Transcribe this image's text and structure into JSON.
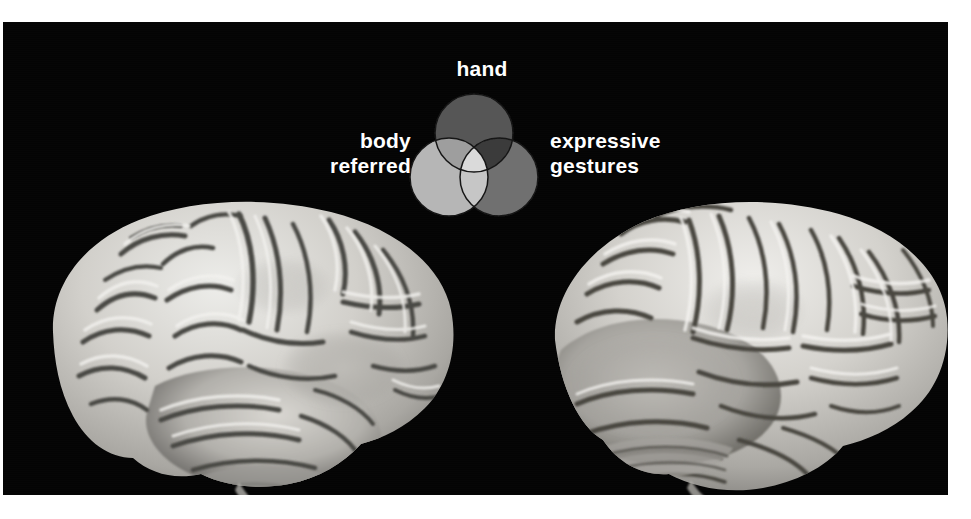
{
  "figure": {
    "panel_background": "#040404",
    "page_background": "#ffffff",
    "description_name": "brain-surface-venn-figure"
  },
  "venn": {
    "labels": {
      "top": "hand",
      "left": "body\nreferred",
      "right": "expressive\ngestures"
    },
    "sets": [
      {
        "key": "hand",
        "label": "hand",
        "position": "top",
        "fill": "#565656"
      },
      {
        "key": "body_referred",
        "label": "body referred",
        "position": "left",
        "fill": "#b6b6b6"
      },
      {
        "key": "expressive_gestures",
        "label": "expressive gestures",
        "position": "right",
        "fill": "#6f6f6f"
      }
    ],
    "overlaps": [
      {
        "key": "hand_body",
        "sets": [
          "hand",
          "body_referred"
        ],
        "fill": "#9e9e9e"
      },
      {
        "key": "hand_expressive",
        "sets": [
          "hand",
          "expressive_gestures"
        ],
        "fill": "#3b3b3b"
      },
      {
        "key": "body_expressive",
        "sets": [
          "body_referred",
          "expressive_gestures"
        ],
        "fill": "#c6c6c6"
      },
      {
        "key": "all_three",
        "sets": [
          "hand",
          "body_referred",
          "expressive_gestures"
        ],
        "fill": "#dadada"
      }
    ],
    "outline_color": "#151515",
    "label_color": "#ffffff"
  },
  "brains": [
    {
      "key": "left_hemisphere",
      "name": "brain-render-left",
      "view": "lateral surface rendering",
      "tint": "#c9c7c2"
    },
    {
      "key": "right_hemisphere",
      "name": "brain-render-right",
      "view": "lateral surface rendering",
      "tint": "#c9c7c2"
    }
  ]
}
